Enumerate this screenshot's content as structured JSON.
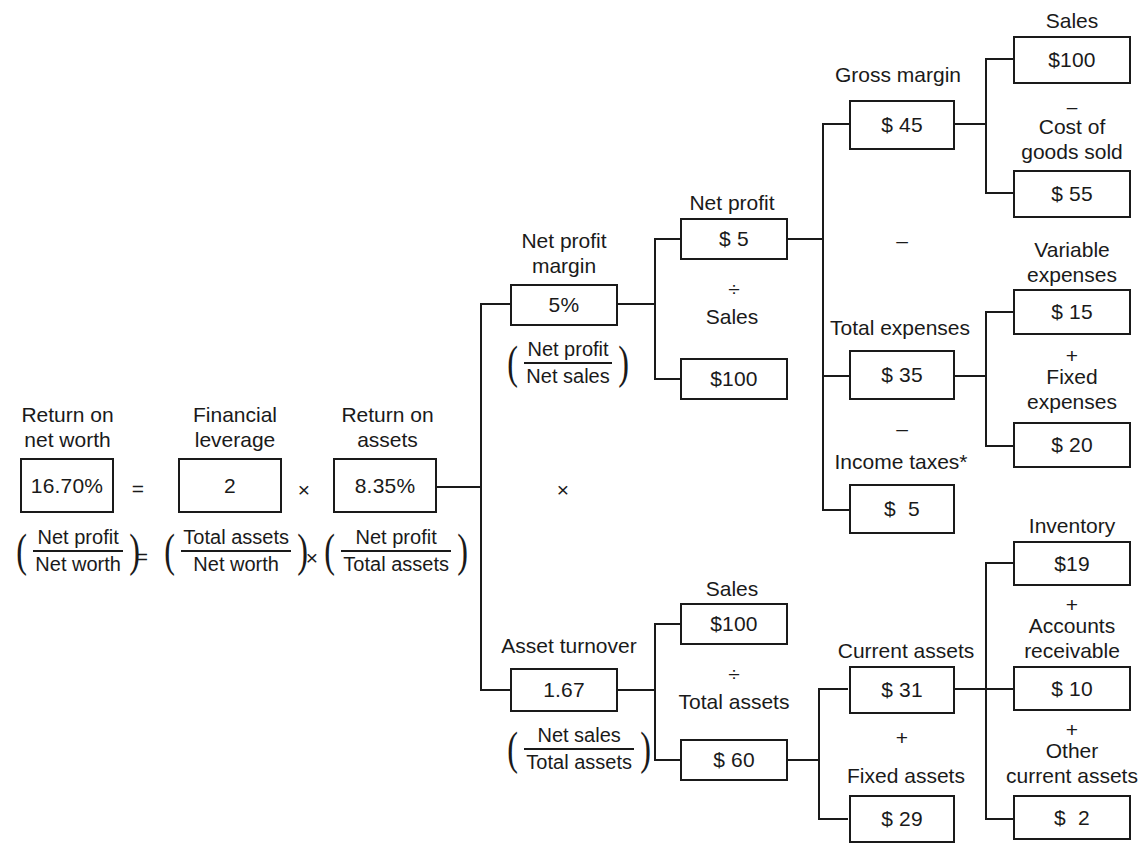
{
  "diagram": {
    "operators": {
      "equals": "=",
      "times": "×",
      "divide": "÷",
      "plus": "+",
      "minus": "–"
    }
  },
  "level1": {
    "ronw": {
      "label": "Return on\nnet worth",
      "value": "16.70%",
      "formula_num": "Net profit",
      "formula_den": "Net worth"
    },
    "eq1": "=",
    "leverage": {
      "label": "Financial\nleverage",
      "value": "2",
      "formula_num": "Total assets",
      "formula_den": "Net worth"
    },
    "mul1": "×",
    "roa": {
      "label": "Return on\nassets",
      "value": "8.35%",
      "formula_num": "Net profit",
      "formula_den": "Total assets"
    },
    "eq2": "=",
    "mul2": "×"
  },
  "level2": {
    "branch_operator": "×",
    "net_profit_margin": {
      "label": "Net profit\nmargin",
      "value": "5%",
      "formula_num": "Net profit",
      "formula_den": "Net sales"
    },
    "asset_turnover": {
      "label": "Asset turnover",
      "value": "1.67",
      "formula_num": "Net sales",
      "formula_den": "Total assets"
    }
  },
  "level3": {
    "net_profit": {
      "label": "Net profit",
      "value": "$ 5"
    },
    "divide_top": "÷",
    "sales_top": {
      "label": "Sales",
      "value": "$100"
    },
    "sales_bottom": {
      "label": "Sales",
      "value": "$100"
    },
    "divide_bottom": "÷",
    "total_assets": {
      "label": "Total assets",
      "value": "$ 60"
    }
  },
  "level4": {
    "gross_margin": {
      "label": "Gross margin",
      "value": "$ 45"
    },
    "minus_1": "–",
    "total_expenses": {
      "label": "Total expenses",
      "value": "$ 35"
    },
    "minus_2": "–",
    "income_taxes": {
      "label": "Income taxes*",
      "value": "$  5"
    },
    "current_assets": {
      "label": "Current assets",
      "value": "$ 31"
    },
    "plus_1": "+",
    "fixed_assets": {
      "label": "Fixed assets",
      "value": "$ 29"
    }
  },
  "level5": {
    "sales": {
      "label": "Sales",
      "value": "$100"
    },
    "minus_cogs": "–",
    "cost_of_goods_sold": {
      "label": "Cost of\ngoods sold",
      "value": "$ 55"
    },
    "variable_expenses": {
      "label": "Variable\nexpenses",
      "value": "$ 15"
    },
    "plus_fixed": "+",
    "fixed_expenses": {
      "label": "Fixed\nexpenses",
      "value": "$ 20"
    },
    "inventory": {
      "label": "Inventory",
      "value": "$19"
    },
    "plus_ar": "+",
    "accounts_receivable": {
      "label": "Accounts\nreceivable",
      "value": "$ 10"
    },
    "plus_oca": "+",
    "other_current_assets": {
      "label": "Other\ncurrent assets",
      "value": "$  2"
    }
  }
}
